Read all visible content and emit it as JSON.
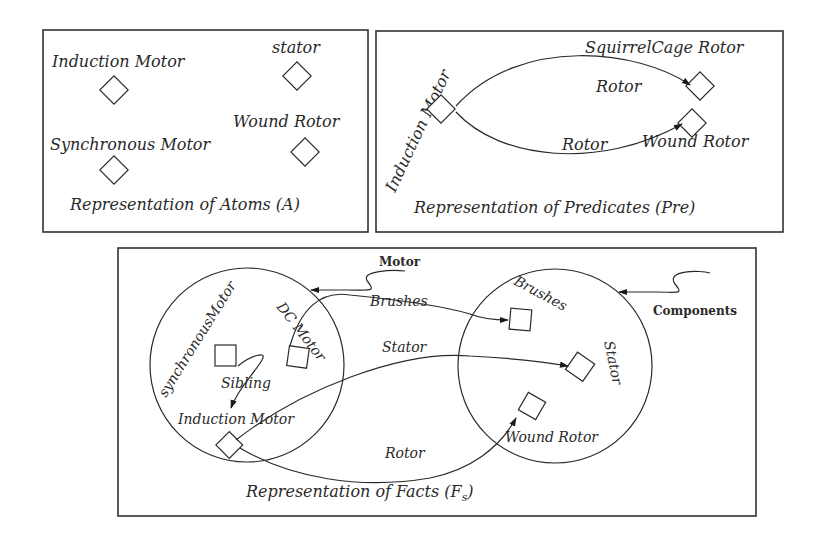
{
  "panels": {
    "atoms": {
      "caption": "Representation of Atoms (A)",
      "nodes": [
        {
          "label": "Induction Motor"
        },
        {
          "label": "stator"
        },
        {
          "label": "Synchronous Motor"
        },
        {
          "label": "Wound Rotor"
        }
      ]
    },
    "predicates": {
      "caption": "Representation of Predicates (Pre)",
      "source_label": "Induction Motor",
      "targets": [
        {
          "label": "SquirrelCage Rotor",
          "edge_label": "Rotor"
        },
        {
          "label": "Wound Rotor",
          "edge_label": "Rotor"
        }
      ]
    },
    "facts": {
      "caption": "Representation of Facts (F",
      "caption_sub": "s",
      "caption_close": ")",
      "motor_class": {
        "title": "Motor",
        "members": [
          {
            "label": "synchronousMotor"
          },
          {
            "label": "DC Motor"
          },
          {
            "label": "Induction Motor"
          }
        ],
        "sibling_label": "Sibling"
      },
      "components_class": {
        "title": "Components",
        "members": [
          {
            "label": "Brushes"
          },
          {
            "label": "Stator"
          },
          {
            "label": "Wound Rotor"
          }
        ]
      },
      "edges": [
        {
          "label": "Brushes"
        },
        {
          "label": "Stator"
        },
        {
          "label": "Rotor"
        }
      ]
    }
  }
}
